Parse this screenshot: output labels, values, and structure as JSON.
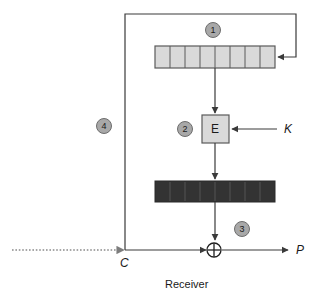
{
  "diagram": {
    "caption": "Receiver",
    "labels": {
      "ciphertext_in": "C",
      "key_in": "K",
      "plaintext_out": "P",
      "encrypt_box": "E"
    },
    "badges": [
      {
        "id": "badge-1",
        "label": "1"
      },
      {
        "id": "badge-2",
        "label": "2"
      },
      {
        "id": "badge-3",
        "label": "3"
      },
      {
        "id": "badge-4",
        "label": "4"
      }
    ],
    "shift_register": {
      "name": "shift-register",
      "cells": 8,
      "fill": "#d9d9d9",
      "stroke": "#5a5a5a"
    },
    "keystream_register": {
      "name": "keystream-register",
      "cells": 8,
      "fill": "#333333",
      "stroke": "#555555"
    },
    "xor": {
      "name": "xor-operator",
      "glyph": "+"
    },
    "colors": {
      "line": "#3a3a3a",
      "dotted_line": "#8a8a8a",
      "badge_fill": "#a8a8a8",
      "badge_stroke": "#6d6d6d",
      "box_fill": "#d9d9d9",
      "box_stroke": "#5a5a5a",
      "text": "#1a1a1a",
      "background": "#ffffff"
    }
  }
}
